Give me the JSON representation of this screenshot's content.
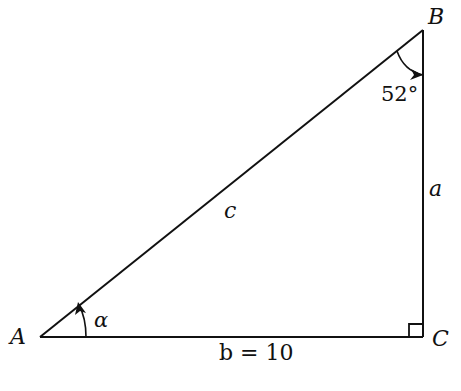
{
  "diagram": {
    "vertices": {
      "A": "A",
      "B": "B",
      "C": "C"
    },
    "sides": {
      "a": "a",
      "b": "b = 10",
      "c": "c"
    },
    "angles": {
      "B": "52°",
      "A": "α"
    },
    "right_angle_at": "C",
    "colors": {
      "stroke": "#111111",
      "background": "#ffffff"
    }
  }
}
